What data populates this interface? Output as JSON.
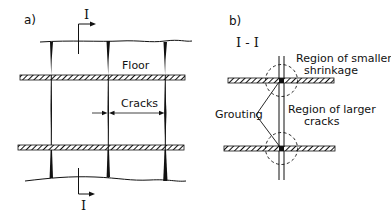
{
  "panel_a": {
    "label": "a)",
    "section_top_label": "I",
    "section_bottom_label": "I",
    "floor_label": "Floor",
    "cracks_label": "Cracks"
  },
  "panel_b": {
    "label": "b)",
    "section_label": "I - I",
    "smaller_shrinkage_line1": "Region of smaller",
    "smaller_shrinkage_line2": "shrinkage",
    "grouting_label": "Grouting",
    "larger_cracks_line1": "Region of larger",
    "larger_cracks_line2": "cracks"
  },
  "colors": {
    "ink": "#111111",
    "background": "#ffffff"
  }
}
